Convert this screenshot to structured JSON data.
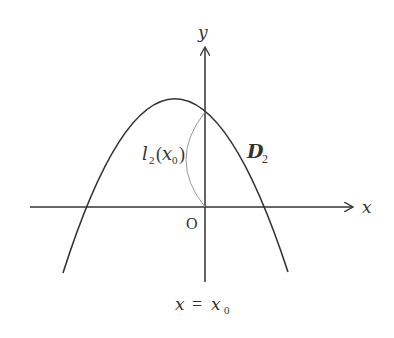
{
  "diagram": {
    "axes": {
      "x_label": "x",
      "y_label": "y",
      "origin_label": "O"
    },
    "curve": {
      "name": "D",
      "subscript": "2",
      "shape": "downward parabola"
    },
    "arc_label": {
      "l": "l",
      "subscript": "2",
      "open": "(",
      "arg": "x",
      "arg_subscript": "0",
      "close": ")"
    },
    "vertical_line_label": {
      "lhs": "x",
      "eq": "=",
      "rhs": "x",
      "rhs_subscript": "0"
    },
    "colors": {
      "stroke": "#333333",
      "arc": "#999999",
      "background": "#ffffff"
    }
  }
}
